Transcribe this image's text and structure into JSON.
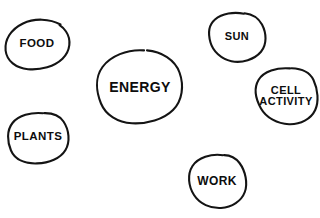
{
  "diagram": {
    "kind": "hand-drawn-concept-bubbles",
    "background_color": "#ffffff",
    "stroke_color": "#141414",
    "text_color": "#0d0d0d",
    "width": 320,
    "height": 218,
    "nodes": [
      {
        "id": "food",
        "label": "FOOD",
        "lines": [
          "FOOD"
        ],
        "cx": 37,
        "cy": 44,
        "rx": 32,
        "ry": 25,
        "font_size": 11.5
      },
      {
        "id": "sun",
        "label": "SUN",
        "lines": [
          "SUN"
        ],
        "cx": 237,
        "cy": 37,
        "rx": 28,
        "ry": 25,
        "font_size": 11
      },
      {
        "id": "energy",
        "label": "ENERGY",
        "lines": [
          "ENERGY"
        ],
        "cx": 140,
        "cy": 87,
        "rx": 43,
        "ry": 37,
        "font_size": 14
      },
      {
        "id": "cell-activity",
        "label": "CELL ACTIVITY",
        "lines": [
          "CELL",
          "ACTIVITY"
        ],
        "cx": 286,
        "cy": 96,
        "rx": 30,
        "ry": 28,
        "font_size": 11
      },
      {
        "id": "plants",
        "label": "PLANTS",
        "lines": [
          "PLANTS"
        ],
        "cx": 38,
        "cy": 137,
        "rx": 30,
        "ry": 25,
        "font_size": 11.5
      },
      {
        "id": "work",
        "label": "WORK",
        "lines": [
          "WORK"
        ],
        "cx": 217,
        "cy": 181,
        "rx": 28,
        "ry": 27,
        "font_size": 12
      }
    ]
  }
}
